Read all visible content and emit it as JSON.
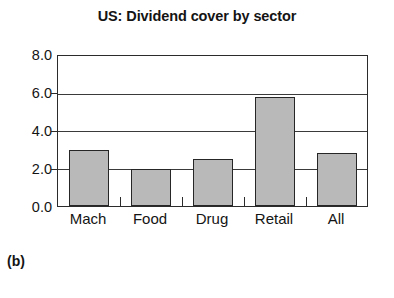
{
  "chart_data": {
    "type": "bar",
    "title": "US: Dividend cover by sector",
    "xlabel": "",
    "ylabel": "",
    "categories": [
      "Mach",
      "Food",
      "Drug",
      "Retail",
      "All"
    ],
    "values": [
      3.0,
      2.0,
      2.5,
      5.8,
      2.85
    ],
    "ylim": [
      0.0,
      8.0
    ],
    "yticks": [
      "0.0",
      "2.0",
      "4.0",
      "6.0",
      "8.0"
    ],
    "ytick_values": [
      0.0,
      2.0,
      4.0,
      6.0,
      8.0
    ],
    "grid": true,
    "legend": "none",
    "bar_fill_color": "#b9b9b9",
    "bar_border_color": "#262626",
    "axis_color": "#2b2b2b"
  },
  "figure": {
    "caption": "(b)"
  }
}
